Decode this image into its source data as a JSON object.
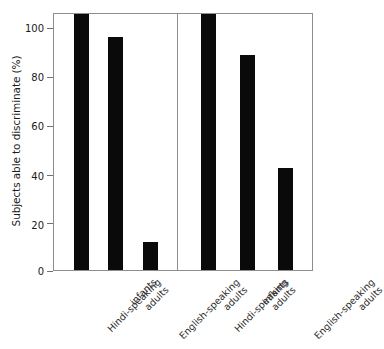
{
  "chart_data": {
    "type": "bar",
    "title": "",
    "xlabel": "",
    "ylabel": "Subjects able to discriminate (%)",
    "ylim": [
      0,
      100
    ],
    "yticks": [
      0,
      20,
      40,
      60,
      80,
      100
    ],
    "ytick_labels": [
      "0",
      "20",
      "40",
      "60",
      "80",
      "100"
    ],
    "grid": false,
    "legend": "none",
    "bar_color": "#0a0a0a",
    "frame_color": "#8d8d8d",
    "panels": [
      {
        "name": "left-panel",
        "categories": [
          "Hindi-speaking adults",
          "infants",
          "English-speaking adults"
        ],
        "category_lines": [
          [
            "Hindi-speaking",
            "adults"
          ],
          [
            "infants",
            ""
          ],
          [
            "English-speaking",
            "adults"
          ]
        ],
        "values": [
          100,
          91,
          11
        ]
      },
      {
        "name": "right-panel",
        "categories": [
          "Hindi-speaking adults",
          "infants",
          "English-speaking adults"
        ],
        "category_lines": [
          [
            "Hindi-speaking",
            "adults"
          ],
          [
            "infants",
            ""
          ],
          [
            "English-speaking",
            "adults"
          ]
        ],
        "values": [
          100,
          84,
          40
        ]
      }
    ]
  },
  "axis": {
    "y_title": "Subjects able to discriminate (%)",
    "ticks": [
      "100",
      "80",
      "60",
      "40",
      "20",
      "0"
    ]
  },
  "labels": {
    "hindi_l1": "Hindi-speaking",
    "hindi_l2": "adults",
    "infants_l1": "infants",
    "english_l1": "English-speaking",
    "english_l2": "adults"
  }
}
